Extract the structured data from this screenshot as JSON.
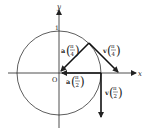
{
  "diagram": {
    "axes": {
      "x_label": "x",
      "y_label": "y",
      "origin_label": "O",
      "tick_label_y": "1"
    },
    "circle": {
      "radius_label": "1"
    },
    "vectors": [
      {
        "id": "a_pi_4",
        "name": "a",
        "arg_num": "π",
        "arg_den": "4"
      },
      {
        "id": "v_pi_4",
        "name": "v",
        "arg_num": "π",
        "arg_den": "4"
      },
      {
        "id": "a_pi_2",
        "name": "a",
        "arg_num": "π",
        "arg_den": "2"
      },
      {
        "id": "v_pi_2",
        "name": "v",
        "arg_num": "π",
        "arg_den": "2"
      }
    ],
    "colors": {
      "stroke": "#222222",
      "background": "#ffffff"
    }
  }
}
